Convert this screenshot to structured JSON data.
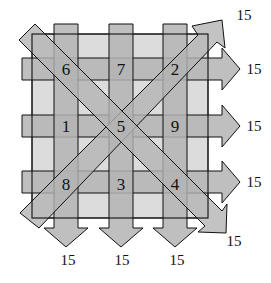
{
  "diagram": {
    "magic_sum": "15",
    "grid": [
      [
        "6",
        "7",
        "2"
      ],
      [
        "1",
        "5",
        "9"
      ],
      [
        "8",
        "3",
        "4"
      ]
    ],
    "cells": {
      "r0c0": "6",
      "r0c1": "7",
      "r0c2": "2",
      "r1c0": "1",
      "r1c1": "5",
      "r1c2": "9",
      "r2c0": "8",
      "r2c1": "3",
      "r2c2": "4"
    },
    "row_sums": [
      "15",
      "15",
      "15"
    ],
    "column_sums": [
      "15",
      "15",
      "15"
    ],
    "diagonal_sums": {
      "anti_diagonal": "15",
      "main_diagonal": "15"
    },
    "colors": {
      "band_fill": "#b4b4b4",
      "square_fill": "#dcdcdc",
      "stroke": "#111111"
    }
  }
}
